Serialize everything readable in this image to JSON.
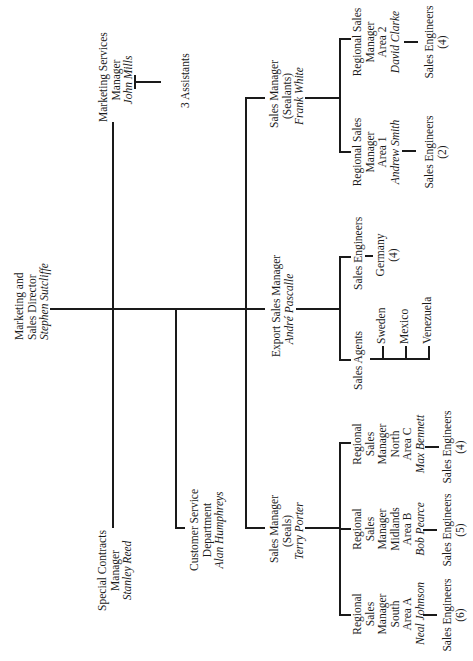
{
  "chart": {
    "orientation": "rotated-90-ccw",
    "root": {
      "title": "Marketing and Sales Director",
      "title_line1": "Marketing and",
      "title_line2": "Sales Director",
      "name": "Stephen Sutcliffe"
    },
    "marketing_services": {
      "title_line1": "Marketing Services",
      "title_line2": "Manager",
      "name": "John Mills",
      "assistants": "3 Assistants"
    },
    "special_contracts": {
      "title_line1": "Special Contracts",
      "title_line2": "Manager",
      "name": "Stanley Reed"
    },
    "customer_service": {
      "title_line1": "Customer Service",
      "title_line2": "Department",
      "name": "Alan Humphreys"
    },
    "sales_sealants": {
      "title_line1": "Sales Manager",
      "title_line2": "(Sealants)",
      "name": "Frank White",
      "regions": [
        {
          "l1": "Regional Sales",
          "l2": "Manager",
          "l3": "Area 1",
          "name": "Andrew Smith",
          "engineers": "Sales Engineers",
          "count": "(2)"
        },
        {
          "l1": "Regional Sales",
          "l2": "Manager",
          "l3": "Area 2",
          "name": "David Clarke",
          "engineers": "Sales Engineers",
          "count": "(4)"
        }
      ]
    },
    "export": {
      "title": "Export Sales Manager",
      "name": "André Pascalle",
      "agents_label": "Sales Agents",
      "agents": [
        "Sweden",
        "Mexico",
        "Venezuela"
      ],
      "engineers_label": "Sales Engineers",
      "engineers_country": "Germany",
      "engineers_count": "(4)"
    },
    "sales_seals": {
      "title_line1": "Sales Manager",
      "title_line2": "(Seals)",
      "name": "Terry Porter",
      "regions": [
        {
          "l1": "Regional",
          "l2": "Sales",
          "l3": "Manager",
          "l4": "South",
          "l5": "Area A",
          "name": "Neal Johnson",
          "engineers": "Sales Engineers",
          "count": "(6)"
        },
        {
          "l1": "Regional",
          "l2": "Sales",
          "l3": "Manager",
          "l4": "Midlands",
          "l5": "Area B",
          "name": "Bob Pearce",
          "engineers": "Sales Engineers",
          "count": "(5)"
        },
        {
          "l1": "Regional",
          "l2": "Sales",
          "l3": "Manager",
          "l4": "North",
          "l5": "Area C",
          "name": "Max Bennett",
          "engineers": "Sales Engineers",
          "count": "(4)"
        }
      ]
    }
  }
}
